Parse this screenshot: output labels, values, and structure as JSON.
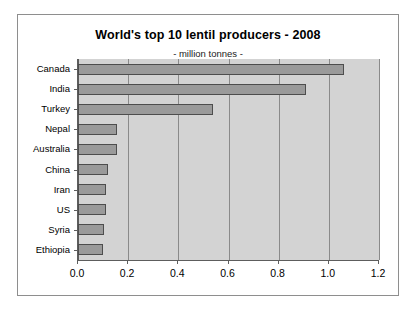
{
  "chart_data": {
    "type": "bar",
    "orientation": "horizontal",
    "title": "World's top 10 lentil producers - 2008",
    "subtitle": "- million tonnes -",
    "xlabel": "",
    "ylabel": "",
    "categories": [
      "Canada",
      "India",
      "Turkey",
      "Nepal",
      "Australia",
      "China",
      "Iran",
      "US",
      "Syria",
      "Ethiopia"
    ],
    "values": [
      1.06,
      0.91,
      0.54,
      0.155,
      0.155,
      0.12,
      0.11,
      0.11,
      0.105,
      0.1
    ],
    "series": [
      {
        "name": "Production",
        "values": [
          1.06,
          0.91,
          0.54,
          0.155,
          0.155,
          0.12,
          0.11,
          0.11,
          0.105,
          0.1
        ]
      }
    ],
    "xlim": [
      0.0,
      1.2
    ],
    "xticks": [
      0.0,
      0.2,
      0.4,
      0.6,
      0.8,
      1.0,
      1.2
    ],
    "xtick_labels": [
      "0.0",
      "0.2",
      "0.4",
      "0.6",
      "0.8",
      "1.0",
      "1.2"
    ],
    "grid": "vertical",
    "legend": "none",
    "colors": {
      "bar_fill": "#9a9a9a",
      "bar_stroke": "#4d4d4d",
      "plot_background": "#d3d3d3",
      "gridline": "#8a8a8a",
      "axis": "#5d5d5d",
      "frame": "#8e8e8e",
      "page_background": "#ffffff",
      "text": "#000000"
    }
  }
}
